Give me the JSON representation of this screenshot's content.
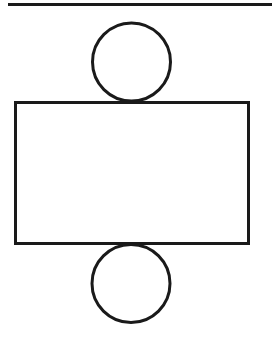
{
  "diagram": {
    "type": "cylinder-net",
    "stroke_color": "#1a1a1a",
    "background": "#ffffff",
    "top_line": {
      "x1": 8,
      "y1": 4.5,
      "x2": 272,
      "y2": 4.5,
      "stroke_width": 3
    },
    "top_circle": {
      "cx": 131.5,
      "cy": 62,
      "r": 39,
      "stroke_width": 3
    },
    "rectangle": {
      "x": 15.5,
      "y": 102.5,
      "width": 233,
      "height": 141,
      "stroke_width": 3
    },
    "bottom_circle": {
      "cx": 131,
      "cy": 283.5,
      "r": 39,
      "stroke_width": 3
    }
  }
}
